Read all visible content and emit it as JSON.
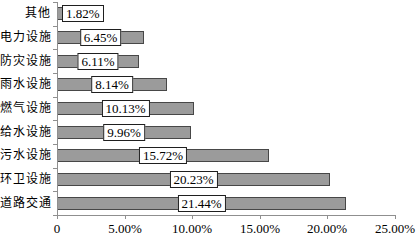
{
  "chart_data": {
    "type": "bar",
    "orientation": "horizontal",
    "title": "",
    "categories": [
      "其他",
      "电力设施",
      "防灾设施",
      "雨水设施",
      "燃气设施",
      "给水设施",
      "污水设施",
      "环卫设施",
      "道路交通"
    ],
    "values": [
      1.82,
      6.45,
      6.11,
      8.14,
      10.13,
      9.96,
      15.72,
      20.23,
      21.44
    ],
    "data_labels": [
      "1.82%",
      "6.45%",
      "6.11%",
      "8.14%",
      "10.13%",
      "9.96%",
      "15.72%",
      "20.23%",
      "21.44%"
    ],
    "xlabel": "",
    "ylabel": "",
    "x_axis": {
      "range": [
        0,
        25
      ],
      "ticks": [
        0,
        5,
        10,
        15,
        20,
        25
      ],
      "tick_labels": [
        "0",
        "5.00%",
        "10.00%",
        "15.00%",
        "20.00%",
        "25.00%"
      ]
    },
    "legend": "none",
    "grid": "off",
    "colors": {
      "bar_fill": "#9b9b9b",
      "bar_border": "#474747",
      "axis": "#8f8f8f",
      "label_box_bg": "#ffffff",
      "label_box_border": "#1f1f1f",
      "text": "#000000",
      "background": "#ffffff"
    }
  }
}
